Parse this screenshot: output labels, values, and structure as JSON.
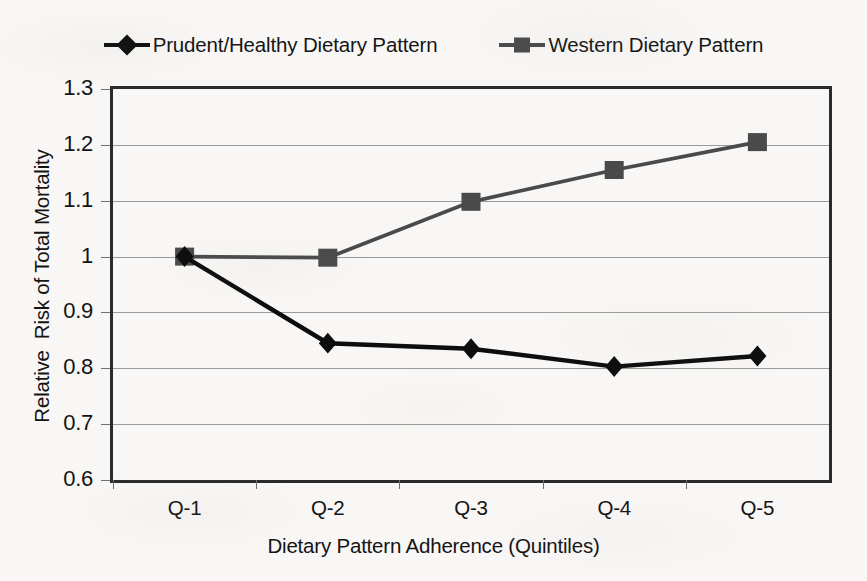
{
  "chart_data": {
    "type": "line",
    "title": "",
    "subtitle": "",
    "xlabel": "Dietary Pattern Adherence (Quintiles)",
    "ylabel": "Relative  Risk of Total Mortality",
    "categories": [
      "Q-1",
      "Q-2",
      "Q-3",
      "Q-4",
      "Q-5"
    ],
    "series": [
      {
        "name": "Prudent/Healthy Dietary Pattern",
        "marker": "diamond",
        "color": "#0d0d0d",
        "values": [
          1.0,
          0.845,
          0.835,
          0.803,
          0.822
        ]
      },
      {
        "name": "Western Dietary Pattern",
        "marker": "square",
        "color": "#4a4a4a",
        "values": [
          1.0,
          0.998,
          1.098,
          1.155,
          1.205
        ]
      }
    ],
    "ylim": [
      0.6,
      1.3
    ],
    "ytick_values": [
      1.3,
      1.2,
      1.1,
      1.0,
      0.9,
      0.8,
      0.7,
      0.6
    ],
    "ytick_labels": [
      "1.3",
      "1.2",
      "1.1",
      "1",
      "0.9",
      "0.8",
      "0.7",
      "0.6"
    ],
    "grid": true,
    "grid_axis": "y",
    "legend_position": "top",
    "annotations": []
  },
  "legend": {
    "items": [
      {
        "label": "Prudent/Healthy Dietary Pattern",
        "marker": "diamond",
        "color": "#0d0d0d"
      },
      {
        "label": "Western Dietary Pattern",
        "marker": "square",
        "color": "#4a4a4a"
      }
    ]
  },
  "colors": {
    "background": "#f8f7f5",
    "axis": "#2b2b2b",
    "gridline": "#9b9b9b",
    "prudent_series": "#0d0d0d",
    "western_series": "#4a4a4a",
    "text": "#141414"
  }
}
